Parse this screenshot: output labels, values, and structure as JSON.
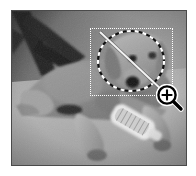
{
  "app": {
    "title": "Image editor selection preview",
    "canvas_label": "photo-canvas"
  },
  "photo": {
    "subject": "Golden retriever puppy lying on carpet",
    "alt_text": "Grayscale photograph of a dog lying on a light carpet next to a white brush, with dark furniture legs in the upper-left background",
    "color_mode": "grayscale",
    "frame_border_color": "#4a4a4a",
    "background_color": "#ffffff",
    "scene_elements": [
      "furniture-legs",
      "dog-body",
      "dog-head",
      "dog-front-paws",
      "white-brush",
      "carpet-floor"
    ]
  },
  "overlays": {
    "selection_rectangle": {
      "name": "marquee-selection",
      "style": "dotted",
      "color": "#ffffff",
      "x": 89,
      "y": 27,
      "width": 83,
      "height": 68
    },
    "lasso_ellipse": {
      "name": "elliptical-marching-ants-selection",
      "style": "dashed",
      "colors": [
        "#000000",
        "#ffffff"
      ],
      "cx": 131,
      "cy": 61,
      "rx": 33,
      "ry": 30
    },
    "diagonal_line": {
      "name": "measure-line",
      "color": "#ffffff",
      "x1": 100,
      "y1": 32,
      "x2": 163,
      "y2": 91
    }
  },
  "cursor": {
    "name": "zoom-in-cursor",
    "glyph": "magnifier-plus",
    "color": "#000000",
    "x": 156,
    "y": 84
  }
}
